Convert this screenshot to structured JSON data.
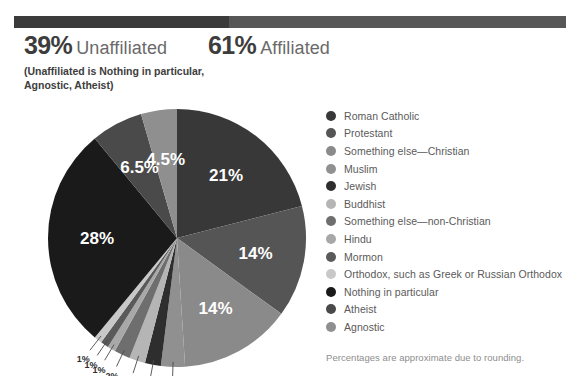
{
  "header": {
    "unaffiliated": {
      "percent": "39%",
      "label": "Unaffiliated",
      "note": "(Unaffiliated is Nothing in particular, Agnostic, Atheist)"
    },
    "affiliated": {
      "percent": "61%",
      "label": "Affiliated"
    },
    "bar": {
      "unaffiliated_color": "#3b3b3b",
      "affiliated_color": "#575757"
    }
  },
  "footnote": "Percentages are approximate due to rounding.",
  "legend": {
    "items": [
      {
        "label": "Roman Catholic",
        "color": "#383838"
      },
      {
        "label": "Protestant",
        "color": "#555555"
      },
      {
        "label": "Something else—Christian",
        "color": "#8a8a8a"
      },
      {
        "label": "Muslim",
        "color": "#909090"
      },
      {
        "label": "Jewish",
        "color": "#2e2e2e"
      },
      {
        "label": "Buddhist",
        "color": "#b5b5b5"
      },
      {
        "label": "Something else—non-Christian",
        "color": "#6e6e6e"
      },
      {
        "label": "Hindu",
        "color": "#a8a8a8"
      },
      {
        "label": "Mormon",
        "color": "#5a5a5a"
      },
      {
        "label": "Orthodox, such as Greek or Russian Orthodox",
        "color": "#c8c8c8"
      },
      {
        "label": "Nothing in particular",
        "color": "#1a1a1a"
      },
      {
        "label": "Atheist",
        "color": "#4a4a4a"
      },
      {
        "label": "Agnostic",
        "color": "#8f8f8f"
      }
    ]
  },
  "chart_data": {
    "type": "pie",
    "title": "",
    "legend_position": "right",
    "total": 100,
    "start_angle_deg": 0,
    "direction": "clockwise",
    "categories": [
      "Roman Catholic",
      "Protestant",
      "Something else—Christian",
      "Muslim",
      "Jewish",
      "Buddhist",
      "Something else—non-Christian",
      "Hindu",
      "Mormon",
      "Orthodox, such as Greek or Russian Orthodox",
      "Nothing in particular",
      "Atheist",
      "Agnostic"
    ],
    "values": [
      21,
      14,
      14,
      3,
      2,
      2,
      2,
      1,
      1,
      1,
      28,
      6.5,
      4.5
    ],
    "labels": [
      "21%",
      "14%",
      "14%",
      "3%",
      "2%",
      "2%",
      "2%",
      "1%",
      "1%",
      "1%",
      "28%",
      "6.5%",
      "4.5%"
    ],
    "colors": [
      "#383838",
      "#555555",
      "#8a8a8a",
      "#909090",
      "#2e2e2e",
      "#b5b5b5",
      "#6e6e6e",
      "#a8a8a8",
      "#5a5a5a",
      "#c8c8c8",
      "#1a1a1a",
      "#4a4a4a",
      "#8f8f8f"
    ],
    "label_placement": [
      "inside",
      "inside",
      "inside",
      "outside",
      "outside",
      "outside",
      "outside",
      "outside",
      "outside",
      "outside",
      "inside",
      "inside",
      "inside"
    ],
    "groups": {
      "Affiliated": 61,
      "Unaffiliated": 39
    },
    "annotation": "Percentages are approximate due to rounding."
  }
}
